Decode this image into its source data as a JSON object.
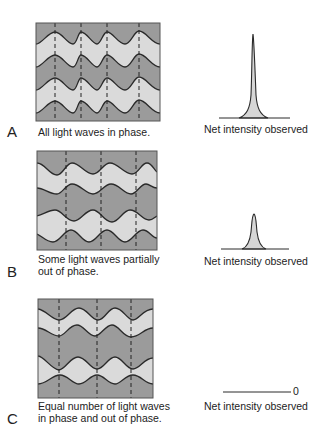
{
  "colors": {
    "dark_band": "#9b9b9b",
    "light_band": "#dadada",
    "line": "#2a2a2a",
    "peak_fill": "#d6d6d6"
  },
  "panels": [
    {
      "letter": "A",
      "caption_lines": [
        "All light waves in phase."
      ],
      "intensity_label": "Net intensity observed",
      "peak": "tall"
    },
    {
      "letter": "B",
      "caption_lines": [
        "Some light waves partially",
        "out of phase."
      ],
      "intensity_label": "Net intensity observed",
      "peak": "short"
    },
    {
      "letter": "C",
      "caption_lines": [
        "Equal number of light waves",
        "in phase and out of phase."
      ],
      "intensity_label": "Net intensity observed",
      "peak": "none",
      "zero_label": "0"
    }
  ]
}
